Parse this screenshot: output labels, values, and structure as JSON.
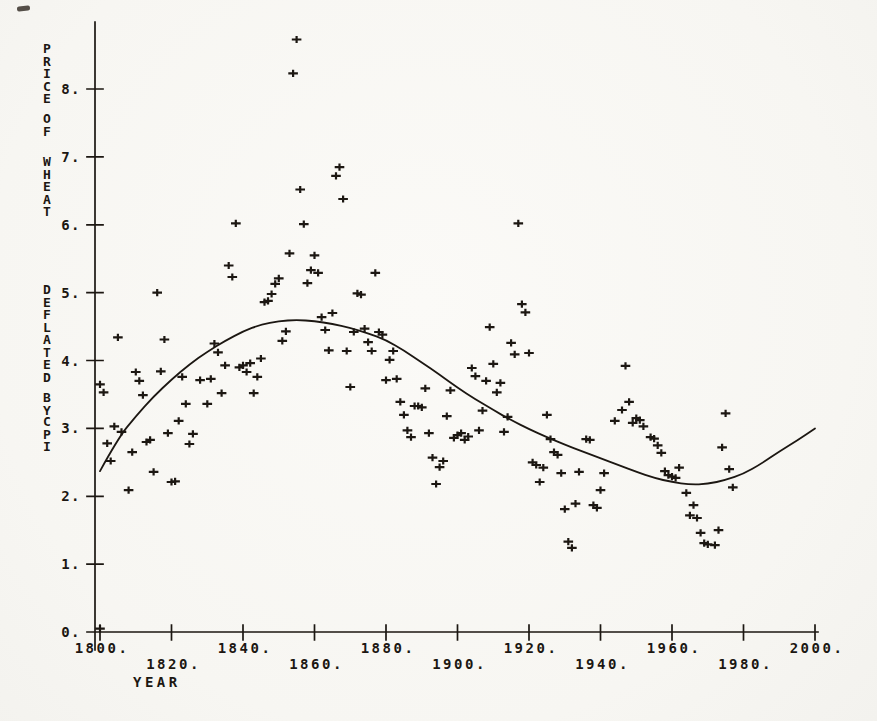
{
  "page": {
    "background": "#f8f7f4",
    "ink": "#1c1712"
  },
  "chart_data": {
    "type": "scatter",
    "title": "",
    "xlabel": "YEAR",
    "ylabel": "PRICE OF WHEAT DEFLATED BY CPI",
    "xlim": [
      1800,
      2000
    ],
    "ylim": [
      0,
      9
    ],
    "grid": false,
    "legend": null,
    "marker": "plus",
    "xticks": [
      1800,
      1820,
      1840,
      1860,
      1880,
      1900,
      1920,
      1940,
      1960,
      1980,
      2000
    ],
    "xtick_labels": [
      "1800.",
      "1820.",
      "1840.",
      "1860.",
      "1880.",
      "1900.",
      "1920.",
      "1940.",
      "1960.",
      "1980.",
      "2000."
    ],
    "yticks": [
      0,
      1,
      2,
      3,
      4,
      5,
      6,
      7,
      8
    ],
    "ytick_labels": [
      "0.",
      "1.",
      "2.",
      "3.",
      "4.",
      "5.",
      "6.",
      "7.",
      "8."
    ],
    "points": [
      [
        1800,
        3.65
      ],
      [
        1800,
        0.05
      ],
      [
        1801,
        3.53
      ],
      [
        1802,
        2.78
      ],
      [
        1803,
        2.52
      ],
      [
        1804,
        3.03
      ],
      [
        1805,
        4.34
      ],
      [
        1806,
        2.95
      ],
      [
        1808,
        2.09
      ],
      [
        1809,
        2.65
      ],
      [
        1810,
        3.83
      ],
      [
        1811,
        3.7
      ],
      [
        1812,
        3.49
      ],
      [
        1813,
        2.8
      ],
      [
        1814,
        2.83
      ],
      [
        1815,
        2.36
      ],
      [
        1816,
        5.0
      ],
      [
        1817,
        3.84
      ],
      [
        1818,
        4.31
      ],
      [
        1819,
        2.93
      ],
      [
        1820,
        2.21
      ],
      [
        1821,
        2.22
      ],
      [
        1822,
        3.11
      ],
      [
        1823,
        3.76
      ],
      [
        1824,
        3.36
      ],
      [
        1825,
        2.77
      ],
      [
        1826,
        2.92
      ],
      [
        1828,
        3.71
      ],
      [
        1830,
        3.36
      ],
      [
        1831,
        3.73
      ],
      [
        1832,
        4.25
      ],
      [
        1833,
        4.12
      ],
      [
        1834,
        3.52
      ],
      [
        1835,
        3.93
      ],
      [
        1836,
        5.4
      ],
      [
        1837,
        5.23
      ],
      [
        1838,
        6.02
      ],
      [
        1839,
        3.9
      ],
      [
        1840,
        3.93
      ],
      [
        1841,
        3.83
      ],
      [
        1842,
        3.96
      ],
      [
        1843,
        3.52
      ],
      [
        1844,
        3.76
      ],
      [
        1845,
        4.03
      ],
      [
        1846,
        4.86
      ],
      [
        1847,
        4.88
      ],
      [
        1848,
        4.98
      ],
      [
        1849,
        5.13
      ],
      [
        1850,
        5.21
      ],
      [
        1851,
        4.29
      ],
      [
        1852,
        4.43
      ],
      [
        1853,
        5.58
      ],
      [
        1854,
        8.23
      ],
      [
        1855,
        8.73
      ],
      [
        1856,
        6.52
      ],
      [
        1857,
        6.01
      ],
      [
        1858,
        5.14
      ],
      [
        1859,
        5.33
      ],
      [
        1860,
        5.55
      ],
      [
        1861,
        5.29
      ],
      [
        1862,
        4.64
      ],
      [
        1863,
        4.45
      ],
      [
        1864,
        4.15
      ],
      [
        1865,
        4.7
      ],
      [
        1866,
        6.72
      ],
      [
        1867,
        6.85
      ],
      [
        1868,
        6.38
      ],
      [
        1869,
        4.14
      ],
      [
        1870,
        3.61
      ],
      [
        1871,
        4.42
      ],
      [
        1872,
        4.99
      ],
      [
        1873,
        4.97
      ],
      [
        1874,
        4.47
      ],
      [
        1875,
        4.27
      ],
      [
        1876,
        4.14
      ],
      [
        1877,
        5.29
      ],
      [
        1878,
        4.42
      ],
      [
        1879,
        4.38
      ],
      [
        1880,
        3.71
      ],
      [
        1881,
        4.01
      ],
      [
        1882,
        4.14
      ],
      [
        1883,
        3.73
      ],
      [
        1884,
        3.39
      ],
      [
        1885,
        3.2
      ],
      [
        1886,
        2.97
      ],
      [
        1887,
        2.87
      ],
      [
        1888,
        3.33
      ],
      [
        1889,
        3.33
      ],
      [
        1890,
        3.31
      ],
      [
        1891,
        3.59
      ],
      [
        1892,
        2.93
      ],
      [
        1893,
        2.57
      ],
      [
        1894,
        2.18
      ],
      [
        1895,
        2.43
      ],
      [
        1896,
        2.52
      ],
      [
        1897,
        3.18
      ],
      [
        1898,
        3.56
      ],
      [
        1899,
        2.86
      ],
      [
        1900,
        2.9
      ],
      [
        1901,
        2.93
      ],
      [
        1902,
        2.83
      ],
      [
        1903,
        2.88
      ],
      [
        1904,
        3.89
      ],
      [
        1905,
        3.77
      ],
      [
        1906,
        2.97
      ],
      [
        1907,
        3.26
      ],
      [
        1908,
        3.7
      ],
      [
        1909,
        4.49
      ],
      [
        1910,
        3.95
      ],
      [
        1911,
        3.53
      ],
      [
        1912,
        3.67
      ],
      [
        1913,
        2.95
      ],
      [
        1914,
        3.17
      ],
      [
        1915,
        4.26
      ],
      [
        1916,
        4.09
      ],
      [
        1917,
        6.02
      ],
      [
        1918,
        4.83
      ],
      [
        1919,
        4.71
      ],
      [
        1920,
        4.11
      ],
      [
        1921,
        2.5
      ],
      [
        1922,
        2.46
      ],
      [
        1923,
        2.21
      ],
      [
        1924,
        2.42
      ],
      [
        1925,
        3.2
      ],
      [
        1926,
        2.84
      ],
      [
        1927,
        2.65
      ],
      [
        1928,
        2.61
      ],
      [
        1929,
        2.34
      ],
      [
        1930,
        1.81
      ],
      [
        1931,
        1.33
      ],
      [
        1932,
        1.24
      ],
      [
        1933,
        1.89
      ],
      [
        1934,
        2.36
      ],
      [
        1936,
        2.84
      ],
      [
        1937,
        2.83
      ],
      [
        1938,
        1.87
      ],
      [
        1939,
        1.83
      ],
      [
        1940,
        2.09
      ],
      [
        1941,
        2.34
      ],
      [
        1944,
        3.11
      ],
      [
        1946,
        3.27
      ],
      [
        1947,
        3.92
      ],
      [
        1948,
        3.39
      ],
      [
        1949,
        3.08
      ],
      [
        1950,
        3.15
      ],
      [
        1951,
        3.12
      ],
      [
        1952,
        3.03
      ],
      [
        1954,
        2.87
      ],
      [
        1955,
        2.85
      ],
      [
        1956,
        2.75
      ],
      [
        1957,
        2.64
      ],
      [
        1958,
        2.37
      ],
      [
        1959,
        2.31
      ],
      [
        1960,
        2.29
      ],
      [
        1961,
        2.27
      ],
      [
        1962,
        2.42
      ],
      [
        1964,
        2.05
      ],
      [
        1965,
        1.72
      ],
      [
        1966,
        1.87
      ],
      [
        1967,
        1.68
      ],
      [
        1968,
        1.46
      ],
      [
        1969,
        1.31
      ],
      [
        1970,
        1.29
      ],
      [
        1972,
        1.28
      ],
      [
        1973,
        1.5
      ],
      [
        1974,
        2.72
      ],
      [
        1975,
        3.22
      ],
      [
        1976,
        2.4
      ],
      [
        1977,
        2.13
      ]
    ],
    "fit_curve": [
      [
        1800,
        2.37
      ],
      [
        1805,
        2.85
      ],
      [
        1810,
        3.18
      ],
      [
        1815,
        3.47
      ],
      [
        1820,
        3.72
      ],
      [
        1825,
        3.94
      ],
      [
        1830,
        4.13
      ],
      [
        1835,
        4.29
      ],
      [
        1840,
        4.43
      ],
      [
        1845,
        4.53
      ],
      [
        1850,
        4.58
      ],
      [
        1855,
        4.6
      ],
      [
        1860,
        4.58
      ],
      [
        1865,
        4.54
      ],
      [
        1870,
        4.48
      ],
      [
        1875,
        4.4
      ],
      [
        1880,
        4.3
      ],
      [
        1885,
        4.15
      ],
      [
        1890,
        3.97
      ],
      [
        1895,
        3.79
      ],
      [
        1900,
        3.6
      ],
      [
        1905,
        3.43
      ],
      [
        1910,
        3.27
      ],
      [
        1915,
        3.12
      ],
      [
        1920,
        2.99
      ],
      [
        1925,
        2.87
      ],
      [
        1930,
        2.76
      ],
      [
        1935,
        2.66
      ],
      [
        1940,
        2.56
      ],
      [
        1945,
        2.46
      ],
      [
        1950,
        2.36
      ],
      [
        1955,
        2.27
      ],
      [
        1960,
        2.21
      ],
      [
        1965,
        2.17
      ],
      [
        1970,
        2.18
      ],
      [
        1975,
        2.24
      ],
      [
        1980,
        2.33
      ],
      [
        1985,
        2.48
      ],
      [
        1990,
        2.66
      ],
      [
        1995,
        2.82
      ],
      [
        2000,
        3.0
      ]
    ]
  }
}
